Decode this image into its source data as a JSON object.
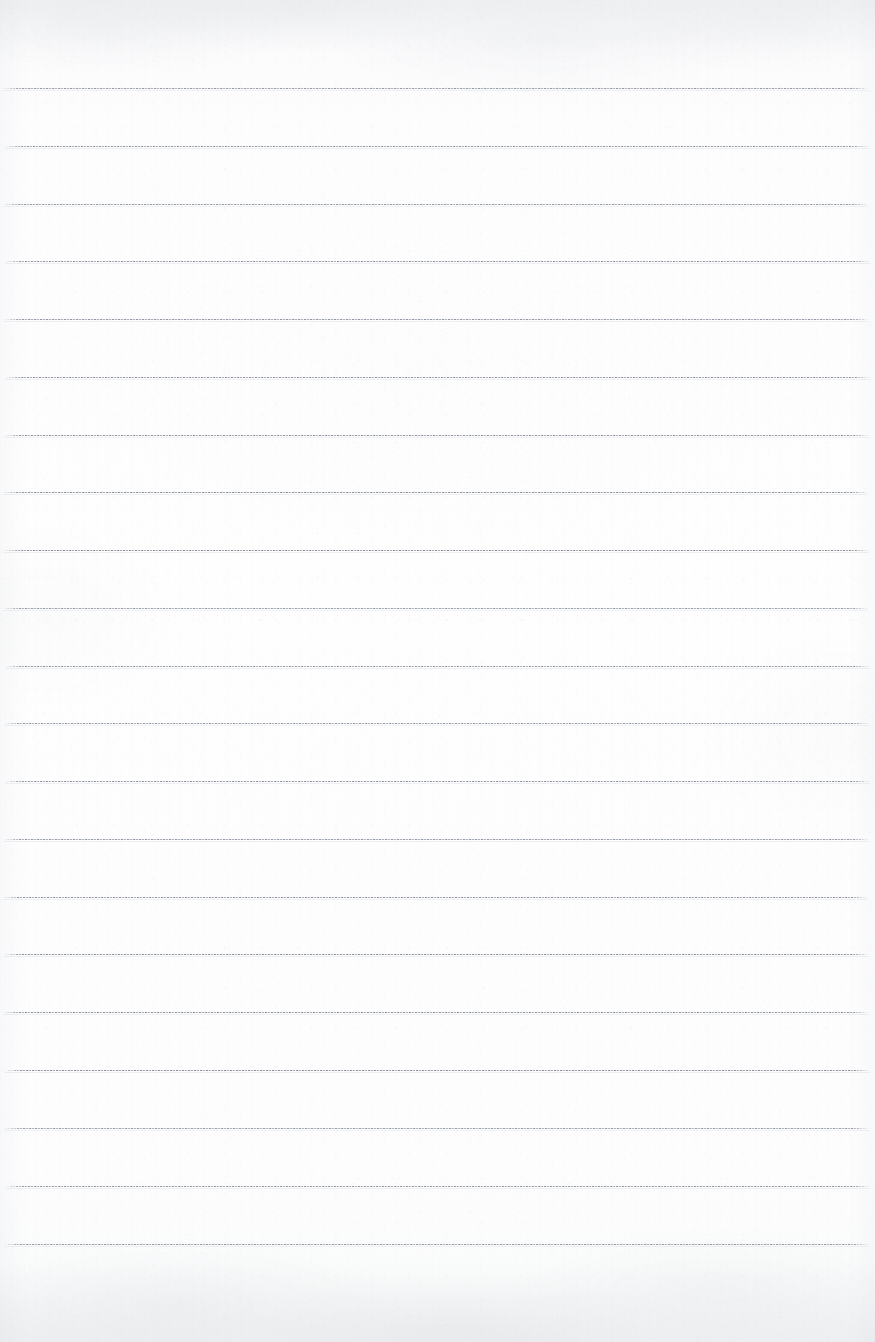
{
  "document": {
    "kind": "scanned-blank-ruled-notebook-page",
    "page_width_px": 875,
    "page_height_px": 1342,
    "orientation": "portrait",
    "written_content": "",
    "title_text": "",
    "header_text": "",
    "footer_text": "",
    "page_number_text": "",
    "has_margin_rule": false,
    "has_holes": false,
    "colors": {
      "paper": "#fdfdfe",
      "paper_shadow": "#f6f7f8",
      "rule": "#7a828c",
      "rule_light": "#a8afb8",
      "rule_highlight": "#cdd2d8"
    }
  },
  "ruling": {
    "line_count": 21,
    "first_line_y": 88,
    "line_spacing_px": 57.8,
    "line_left_x": 4,
    "line_right_x": 869,
    "line_thickness_px": 2,
    "style": "horizontal-ruled",
    "lines_y": [
      88,
      146,
      204,
      261,
      319,
      377,
      435,
      492,
      550,
      608,
      666,
      723,
      781,
      839,
      897,
      954,
      1012,
      1070,
      1128,
      1186,
      1244
    ]
  }
}
